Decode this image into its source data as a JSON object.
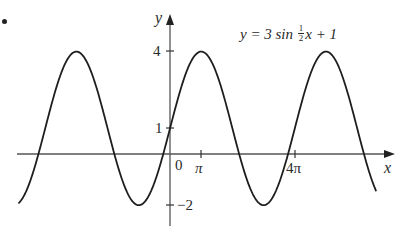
{
  "bullet": "•",
  "chart_data": {
    "type": "line",
    "equation": {
      "prefix": "y = 3 sin ",
      "frac_num": "1",
      "frac_den": "2",
      "suffix": "x + 1"
    },
    "xlabel": "x",
    "ylabel": "y",
    "origin_label": "0",
    "x_ticks": [
      {
        "value": 3.14159,
        "label": "π"
      },
      {
        "value": 12.56637,
        "label": "4π"
      }
    ],
    "y_ticks": [
      {
        "value": 4,
        "label": "4"
      },
      {
        "value": 1,
        "label": "1"
      },
      {
        "value": -2,
        "label": "−2"
      }
    ],
    "xlim": [
      -15.5,
      6.7
    ],
    "xlim_note": "approx -4.9π to 2.1π... see series domain",
    "ylim": [
      -2.5,
      5.0
    ],
    "grid": false,
    "legend": "none",
    "series": [
      {
        "name": "y = 3 sin(x/2) + 1",
        "function": "3*sin(x/2)+1",
        "amplitude": 3,
        "period": "4π",
        "vertical_shift": 1,
        "x_domain": [
          -4.84,
          6.6
        ],
        "x_domain_units": "multiples of π",
        "max": 4,
        "min": -2,
        "maxima_x": [
          "-3π",
          "π",
          "5π"
        ],
        "minima_x": [
          "-π",
          "3π"
        ],
        "y_intercept": 1
      }
    ]
  }
}
